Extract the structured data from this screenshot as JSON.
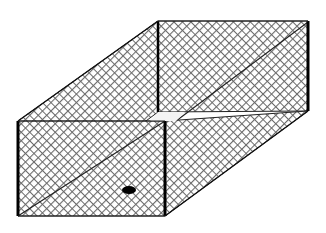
{
  "diagram": {
    "title": "Gabion wire mesh box (isometric view)",
    "colors": {
      "background": "#ffffff",
      "mesh": "#6b6b6b",
      "edge": "#000000",
      "gap_highlight": "#f4f4f4",
      "marker": "#000000"
    },
    "geometry": {
      "back_top_left": [
        158,
        21
      ],
      "back_top_right": [
        308,
        21
      ],
      "back_bottom_left": [
        158,
        112
      ],
      "back_bottom_right": [
        308,
        111
      ],
      "front_top_left": [
        18,
        121
      ],
      "front_top_right": [
        165,
        121
      ],
      "front_bottom_left": [
        18,
        216
      ],
      "front_bottom_right": [
        165,
        216
      ],
      "marker_center": [
        129,
        190
      ],
      "marker_radius": [
        7,
        4
      ]
    },
    "faces": [
      {
        "name": "left-side-panel"
      },
      {
        "name": "back-panel"
      },
      {
        "name": "front-panel"
      },
      {
        "name": "right-side-panel"
      }
    ]
  }
}
